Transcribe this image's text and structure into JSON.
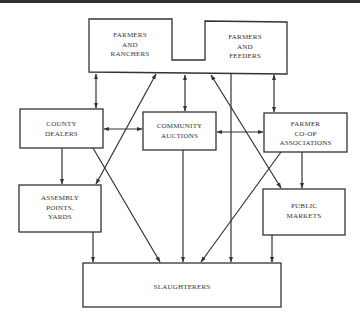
{
  "diagram": {
    "nodes": {
      "farmers_ranchers": {
        "lines": [
          "FARMERS",
          "AND",
          "RANCHERS"
        ]
      },
      "farmers_feeders": {
        "lines": [
          "FARMERS",
          "AND",
          "FEEDERS"
        ]
      },
      "county_dealers": {
        "lines": [
          "COUNTY",
          "DEALERS"
        ]
      },
      "community_auctions": {
        "lines": [
          "COMMUNITY",
          "AUCTIONS"
        ]
      },
      "farmer_coop": {
        "lines": [
          "FARMER",
          "CO-OP",
          "ASSOCIATIONS"
        ]
      },
      "assembly_points": {
        "lines": [
          "ASSEMBLY",
          "POINTS,",
          "YARDS"
        ]
      },
      "public_markets": {
        "lines": [
          "PUBLIC",
          "MARKETS"
        ]
      },
      "slaughterers": {
        "lines": [
          "SLAUGHTERERS"
        ]
      }
    },
    "edges": [
      {
        "from": "farmers",
        "to": "county_dealers",
        "type": "bidirectional"
      },
      {
        "from": "farmers",
        "to": "community_auctions",
        "type": "bidirectional"
      },
      {
        "from": "farmers",
        "to": "farmer_coop",
        "type": "bidirectional"
      },
      {
        "from": "farmers",
        "to": "assembly_points",
        "type": "directed"
      },
      {
        "from": "farmers",
        "to": "public_markets",
        "type": "directed"
      },
      {
        "from": "farmers",
        "to": "slaughterers",
        "type": "directed"
      },
      {
        "from": "county_dealers",
        "to": "community_auctions",
        "type": "bidirectional"
      },
      {
        "from": "community_auctions",
        "to": "farmer_coop",
        "type": "bidirectional"
      },
      {
        "from": "county_dealers",
        "to": "assembly_points",
        "type": "directed"
      },
      {
        "from": "county_dealers",
        "to": "slaughterers",
        "type": "directed"
      },
      {
        "from": "community_auctions",
        "to": "slaughterers",
        "type": "directed"
      },
      {
        "from": "farmer_coop",
        "to": "public_markets",
        "type": "directed"
      },
      {
        "from": "farmer_coop",
        "to": "slaughterers",
        "type": "directed"
      },
      {
        "from": "assembly_points",
        "to": "slaughterers",
        "type": "directed"
      },
      {
        "from": "public_markets",
        "to": "slaughterers",
        "type": "directed"
      }
    ],
    "line_color": "#333333"
  }
}
